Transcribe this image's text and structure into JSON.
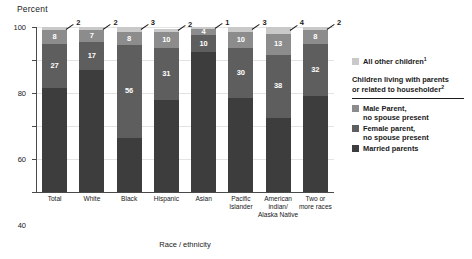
{
  "chart_data": {
    "type": "bar",
    "subtype": "stacked-bar-100",
    "title": "",
    "ylabel": "Percent",
    "xlabel": "Race / ethnicity",
    "ylim": [
      0,
      100
    ],
    "yticks": [
      0,
      20,
      40,
      60,
      80,
      100
    ],
    "ytick_labels": [
      "0",
      "20",
      "40",
      "60",
      "80",
      "100"
    ],
    "grid": true,
    "legend_position": "right",
    "categories": [
      "Total",
      "White",
      "Black",
      "Hispanic",
      "Asian",
      "Pacific Islander",
      "American indian/ Alaska Native",
      "Two or more races"
    ],
    "category_lines": [
      [
        "Total"
      ],
      [
        "White"
      ],
      [
        "Black"
      ],
      [
        "Hispanic"
      ],
      [
        "Asian"
      ],
      [
        "Pacific",
        "Islander"
      ],
      [
        "American",
        "indian/",
        "Alaska Native"
      ],
      [
        "Two or",
        "more races"
      ]
    ],
    "series": [
      {
        "name": "Married parents",
        "color": "#3d3d3d",
        "values": [
          63,
          74,
          33,
          56,
          85,
          57,
          45,
          58
        ]
      },
      {
        "name": "Female parent, no spouse present",
        "color": "#5e5e5e",
        "values": [
          27,
          17,
          56,
          31,
          10,
          30,
          38,
          32
        ]
      },
      {
        "name": "Male Parent, no spouse present",
        "color": "#8c8c8c",
        "values": [
          8,
          7,
          8,
          10,
          4,
          10,
          13,
          8
        ]
      },
      {
        "name": "All other children",
        "color": "#c9c9c9",
        "values": [
          2,
          2,
          3,
          2,
          1,
          3,
          4,
          2
        ]
      }
    ],
    "annotations": [
      "Tiny top segment values shown with leader lines outside the bar"
    ]
  },
  "legend": {
    "other_children": {
      "label": "All other children",
      "superscript": "1",
      "color": "#c9c9c9"
    },
    "heading_line_1": "Children living with parents",
    "heading_line_2": "or related to householder",
    "heading_superscript": "2",
    "entries": [
      {
        "line1": "Male Parent,",
        "line2": "no spouse present",
        "color": "#8c8c8c"
      },
      {
        "line1": "Female parent,",
        "line2": "no spouse present",
        "color": "#5e5e5e"
      },
      {
        "line1": "Married parents",
        "line2": "",
        "color": "#3d3d3d"
      }
    ]
  }
}
